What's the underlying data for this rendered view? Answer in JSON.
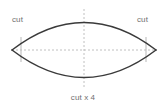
{
  "figure": {
    "background_color": "#ffffff",
    "width": 166,
    "height": 109,
    "shape_name": "lens-vesica-outline",
    "stroke_color": "#3a3a3a",
    "guide_color": "#b9b9b9",
    "tick_color": "#bdbdbd",
    "label_color": "#6f6f6f"
  },
  "labels": {
    "cut_left": "cut",
    "cut_right": "cut",
    "cut_bottom": "cut x 4"
  },
  "geometry": {
    "left_vertex_x": 12,
    "left_vertex_y": 50,
    "right_vertex_x": 156,
    "right_vertex_y": 50,
    "center_x": 84,
    "center_y": 50,
    "top_apex_y": 9,
    "bottom_apex_y": 89,
    "tick_left_x": 21,
    "tick_right_x": 146,
    "tick_top_y": 37,
    "tick_bottom_y": 62
  }
}
